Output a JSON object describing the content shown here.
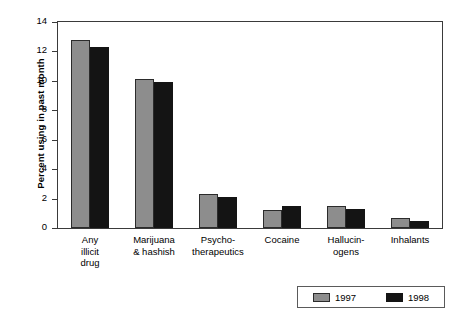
{
  "chart_data": {
    "type": "bar",
    "title": "",
    "xlabel": "",
    "ylabel": "Percent using in past month",
    "ylim": [
      0,
      14
    ],
    "yticks": [
      0,
      2,
      4,
      6,
      8,
      10,
      12,
      14
    ],
    "grid": false,
    "legend_position": "bottom-right",
    "categories": [
      "Any\nillicit\ndrug",
      "Marijuana\n& hashish",
      "Psycho-\ntherapeutics",
      "Cocaine",
      "Hallucin-\nogens",
      "Inhalants"
    ],
    "series": [
      {
        "name": "1997",
        "color": "#8d8d8d",
        "values": [
          12.8,
          10.1,
          2.3,
          1.2,
          1.5,
          0.7
        ]
      },
      {
        "name": "1998",
        "color": "#141414",
        "values": [
          12.3,
          9.9,
          2.1,
          1.5,
          1.3,
          0.5
        ]
      }
    ]
  },
  "legend": {
    "entries": [
      {
        "label": "1997",
        "color": "#8d8d8d"
      },
      {
        "label": "1998",
        "color": "#141414"
      }
    ]
  }
}
